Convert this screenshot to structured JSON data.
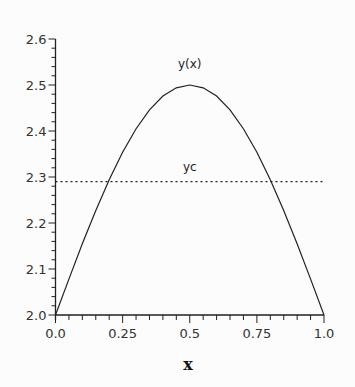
{
  "chart_data": {
    "type": "line",
    "title": "",
    "xlabel": "x",
    "ylabel": "",
    "xlim": [
      0.0,
      1.0
    ],
    "ylim": [
      2.0,
      2.6
    ],
    "x_ticks": [
      "0.0",
      "0.25",
      "0.5",
      "0.75",
      "1.0"
    ],
    "y_ticks": [
      "2.0",
      "2.1",
      "2.2",
      "2.3",
      "2.4",
      "2.5",
      "2.6"
    ],
    "grid": false,
    "legend": "none",
    "annotations": [
      {
        "text": "y(x)",
        "near": "curve peak"
      },
      {
        "text": "yc",
        "near": "horizontal dotted line"
      }
    ],
    "series": [
      {
        "name": "y(x)",
        "style": "solid",
        "x": [
          0.0,
          0.05,
          0.1,
          0.15,
          0.2,
          0.25,
          0.3,
          0.35,
          0.4,
          0.45,
          0.5,
          0.55,
          0.6,
          0.65,
          0.7,
          0.75,
          0.8,
          0.85,
          0.9,
          0.95,
          1.0
        ],
        "values": [
          2.0,
          2.078,
          2.155,
          2.227,
          2.294,
          2.354,
          2.405,
          2.446,
          2.476,
          2.494,
          2.5,
          2.494,
          2.476,
          2.446,
          2.405,
          2.354,
          2.294,
          2.227,
          2.155,
          2.078,
          2.0
        ]
      },
      {
        "name": "yc",
        "style": "dotted",
        "x": [
          0.0,
          1.0
        ],
        "values": [
          2.29,
          2.29
        ]
      }
    ]
  }
}
